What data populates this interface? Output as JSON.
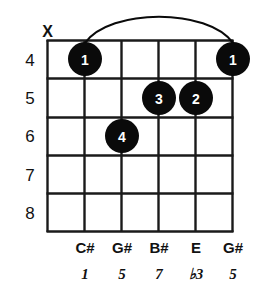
{
  "diagram": {
    "type": "guitar-chord-diagram",
    "orientation": "vertical",
    "string_count": 6,
    "fret_count": 5,
    "colors": {
      "ink": "#1a1a1a",
      "dot_fill": "#0a0a0a",
      "dot_text": "#ffffff",
      "background": "#ffffff"
    }
  },
  "fret_numbers": [
    {
      "label": "4"
    },
    {
      "label": "5"
    },
    {
      "label": "6"
    },
    {
      "label": "7"
    },
    {
      "label": "8"
    }
  ],
  "string_markers": [
    {
      "string": 1,
      "symbol": "X",
      "meaning": "muted"
    }
  ],
  "finger_dots": [
    {
      "finger": "1",
      "string": 2,
      "fret_label": "4"
    },
    {
      "finger": "1",
      "string": 6,
      "fret_label": "4"
    },
    {
      "finger": "3",
      "string": 4,
      "fret_label": "5"
    },
    {
      "finger": "2",
      "string": 5,
      "fret_label": "5"
    },
    {
      "finger": "4",
      "string": 3,
      "fret_label": "6"
    }
  ],
  "barre": {
    "present": true,
    "from_string": 2,
    "to_string": 6,
    "fret_label": "4"
  },
  "note_names": [
    {
      "string": 2,
      "label": "C#"
    },
    {
      "string": 3,
      "label": "G#"
    },
    {
      "string": 4,
      "label": "B#"
    },
    {
      "string": 5,
      "label": "E"
    },
    {
      "string": 6,
      "label": "G#"
    }
  ],
  "intervals": [
    {
      "string": 2,
      "label": "1"
    },
    {
      "string": 3,
      "label": "5"
    },
    {
      "string": 4,
      "label": "7"
    },
    {
      "string": 5,
      "label": "♭3"
    },
    {
      "string": 6,
      "label": "5"
    }
  ]
}
